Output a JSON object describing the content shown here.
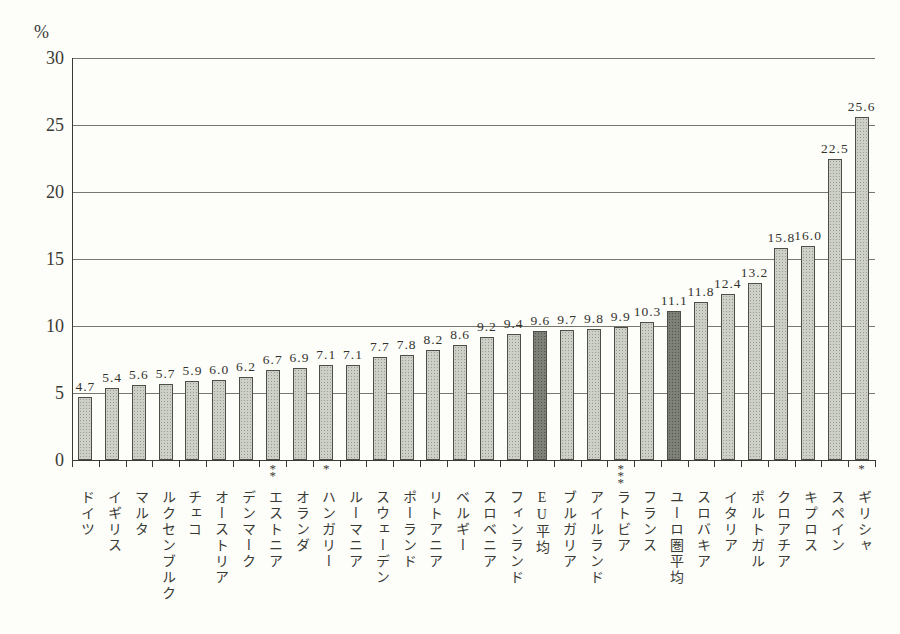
{
  "chart_data": {
    "type": "bar",
    "title": "",
    "xlabel": "",
    "ylabel": "%",
    "ylim": [
      0,
      30
    ],
    "yticks": [
      0,
      5,
      10,
      15,
      20,
      25,
      30
    ],
    "grid": true,
    "legend": "none",
    "categories": [
      "ドイツ",
      "イギリス",
      "マルタ",
      "ルクセンブルク",
      "チェコ",
      "オーストリア",
      "デンマーク",
      "エストニア",
      "オランダ",
      "ハンガリー",
      "ルーマニア",
      "スウェーデン",
      "ポーランド",
      "リトアニア",
      "ベルギー",
      "スロベニア",
      "フィンランド",
      "EU平均",
      "ブルガリア",
      "アイルランド",
      "ラトビア",
      "フランス",
      "ユーロ圏平均",
      "スロバキア",
      "イタリア",
      "ポルトガル",
      "クロアチア",
      "キプロス",
      "スペイン",
      "ギリシャ"
    ],
    "values": [
      4.7,
      5.4,
      5.6,
      5.7,
      5.9,
      6.0,
      6.2,
      6.7,
      6.9,
      7.1,
      7.1,
      7.7,
      7.8,
      8.2,
      8.6,
      9.2,
      9.4,
      9.6,
      9.7,
      9.8,
      9.9,
      10.3,
      11.1,
      11.8,
      12.4,
      13.2,
      15.8,
      16.0,
      22.5,
      25.6
    ],
    "footnote_marks": [
      "",
      "",
      "",
      "",
      "",
      "",
      "",
      "**",
      "",
      "*",
      "",
      "",
      "",
      "",
      "",
      "",
      "",
      "",
      "",
      "",
      "***",
      "",
      "",
      "",
      "",
      "",
      "",
      "",
      "",
      "*"
    ],
    "highlighted_categories": [
      "EU平均",
      "ユーロ圏平均"
    ],
    "colors": {
      "background": "#fdfdfa",
      "bar_fill": "#ccd0c6",
      "bar_fill_highlight": "#7e8178",
      "bar_border": "#4e4e48",
      "axis": "#3b3b36",
      "grid": "#77776f",
      "text": "#3a3a35"
    }
  }
}
